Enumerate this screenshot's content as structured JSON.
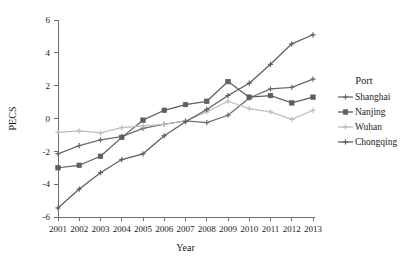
{
  "chart_data": {
    "type": "line",
    "title": "",
    "xlabel": "Year",
    "ylabel": "PECS",
    "x": [
      2001,
      2002,
      2003,
      2004,
      2005,
      2006,
      2007,
      2008,
      2009,
      2010,
      2011,
      2012,
      2013
    ],
    "xtick_labels": [
      "2001",
      "2002",
      "2003",
      "2004",
      "2005",
      "2006",
      "2007",
      "2008",
      "2009",
      "2010",
      "2011",
      "2012",
      "2013"
    ],
    "ytick_labels": [
      "6",
      "4",
      "2",
      "0",
      "-2",
      "-4",
      "-6"
    ],
    "yticks": [
      6,
      4,
      2,
      0,
      -2,
      -4,
      -6
    ],
    "ylim": [
      -6,
      6
    ],
    "xlim": [
      2001,
      2013
    ],
    "grid": false,
    "legend_position": "right",
    "legend_title": "Port",
    "series": [
      {
        "name": "Shanghai",
        "color": "#6b6b6b",
        "marker": "plus",
        "values": [
          -2.15,
          -1.65,
          -1.3,
          -1.1,
          -0.6,
          -0.35,
          -0.15,
          -0.25,
          0.2,
          1.25,
          1.8,
          1.9,
          2.4
        ]
      },
      {
        "name": "Nanjing",
        "color": "#5e5e5e",
        "marker": "square",
        "values": [
          -3.0,
          -2.85,
          -2.3,
          -1.15,
          -0.1,
          0.5,
          0.85,
          1.05,
          2.25,
          1.3,
          1.4,
          0.95,
          1.3
        ]
      },
      {
        "name": "Wuhan",
        "color": "#bdbdbd",
        "marker": "plus",
        "values": [
          -0.85,
          -0.75,
          -0.88,
          -0.55,
          -0.45,
          -0.35,
          -0.15,
          0.4,
          1.05,
          0.6,
          0.4,
          -0.05,
          0.5
        ]
      },
      {
        "name": "Chongqing",
        "color": "#5e5e5e",
        "marker": "plus",
        "values": [
          -5.45,
          -4.3,
          -3.3,
          -2.5,
          -2.15,
          -1.05,
          -0.2,
          0.55,
          1.4,
          2.15,
          3.3,
          4.55,
          5.1
        ]
      }
    ]
  }
}
